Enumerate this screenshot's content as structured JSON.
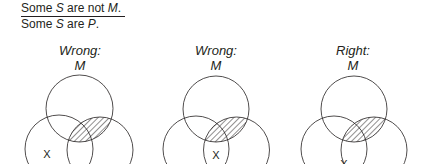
{
  "premises": {
    "line1": {
      "prefix": "Some ",
      "subject": "S",
      "middle": " are not ",
      "predicate": "M",
      "suffix": "."
    },
    "line2": {
      "prefix": "Some ",
      "subject": "S",
      "middle": " are ",
      "predicate": "P",
      "suffix": "."
    }
  },
  "diagrams": [
    {
      "verdict": "Wrong:",
      "top_circle_label": "M",
      "x_mark": "X",
      "x_position": "outside M, inside S only"
    },
    {
      "verdict": "Wrong:",
      "top_circle_label": "M",
      "x_mark": "X",
      "x_position": "in S∩P outside M"
    },
    {
      "verdict": "Right:",
      "top_circle_label": "M",
      "x_mark": "X",
      "x_position": "on boundary of P, outside M"
    }
  ],
  "colors": {
    "stroke": "#231f20",
    "hatch": "#231f20",
    "background": "#ffffff"
  }
}
